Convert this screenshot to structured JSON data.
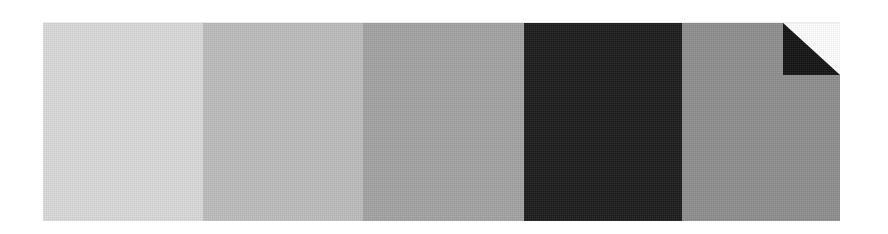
{
  "swatches": [
    {
      "name": "lightest-gray",
      "color": "#dadada",
      "width": 160
    },
    {
      "name": "light-gray",
      "color": "#bdbdbd",
      "width": 160
    },
    {
      "name": "mid-gray",
      "color": "#a3a3a3",
      "width": 161
    },
    {
      "name": "near-black",
      "color": "#1a1a1a",
      "width": 158
    },
    {
      "name": "medium-gray",
      "color": "#8e8e8e",
      "width": 158
    }
  ],
  "fold": {
    "fill": "#121212",
    "background": "#ffffff"
  }
}
